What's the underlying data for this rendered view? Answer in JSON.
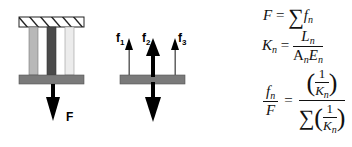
{
  "diagram": {
    "left_panel": {
      "columns": [
        {
          "name": "column-1",
          "color": "#b8b8b8"
        },
        {
          "name": "column-2",
          "color": "#4a4a4a"
        },
        {
          "name": "column-3",
          "color": "#ececec"
        }
      ],
      "plate_color": "#7a7a7a",
      "force_label": "F"
    },
    "right_panel": {
      "plate_color": "#7a7a7a",
      "labels": [
        {
          "text": "f",
          "sub": "1"
        },
        {
          "text": "f",
          "sub": "2"
        },
        {
          "text": "f",
          "sub": "3"
        }
      ]
    },
    "equations": {
      "eq1": {
        "lhs": "F",
        "eq": "=",
        "sigma": "∑",
        "f": "f",
        "sub": "n"
      },
      "eq2": {
        "lhs": "K",
        "lhs_sub": "n",
        "eq": "=",
        "num": "L",
        "num_sub": "n",
        "den_a": "A",
        "den_a_sub": "n",
        "den_e": "E",
        "den_e_sub": "n"
      },
      "eq3": {
        "num": "f",
        "num_sub": "n",
        "den": "F",
        "eq": "=",
        "one": "1",
        "k": "K",
        "k_sub": "n",
        "sigma": "∑",
        "lparen": "(",
        "rparen": ")"
      }
    }
  }
}
